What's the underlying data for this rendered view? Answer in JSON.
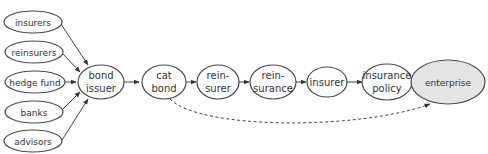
{
  "diagram": {
    "type": "flow",
    "background": "#ffffff",
    "highlight_fill": "#e4e4e4",
    "sources": [
      {
        "id": "insurers",
        "label": "insurers"
      },
      {
        "id": "reinsurers",
        "label": "reinsurers"
      },
      {
        "id": "hedge_fund",
        "label": "hedge fund"
      },
      {
        "id": "banks",
        "label": "banks"
      },
      {
        "id": "advisors",
        "label": "advisors"
      }
    ],
    "chain": [
      {
        "id": "bond_issuer",
        "line1": "bond",
        "line2": "issuer"
      },
      {
        "id": "cat_bond",
        "line1": "cat",
        "line2": "bond"
      },
      {
        "id": "reinsurer",
        "line1": "rein-",
        "line2": "surer"
      },
      {
        "id": "reinsurance",
        "line1": "rein-",
        "line2": "surance"
      },
      {
        "id": "insurer",
        "line1": "insurer"
      },
      {
        "id": "insurance_policy",
        "line1": "insurance",
        "line2": "policy"
      },
      {
        "id": "enterprise",
        "line1": "enterprise",
        "highlighted": true
      }
    ],
    "edges": [
      {
        "from": "insurers",
        "to": "bond_issuer",
        "style": "solid"
      },
      {
        "from": "reinsurers",
        "to": "bond_issuer",
        "style": "solid"
      },
      {
        "from": "hedge_fund",
        "to": "bond_issuer",
        "style": "solid"
      },
      {
        "from": "banks",
        "to": "bond_issuer",
        "style": "solid"
      },
      {
        "from": "advisors",
        "to": "bond_issuer",
        "style": "solid"
      },
      {
        "from": "bond_issuer",
        "to": "cat_bond",
        "style": "solid"
      },
      {
        "from": "cat_bond",
        "to": "reinsurer",
        "style": "solid"
      },
      {
        "from": "reinsurer",
        "to": "reinsurance",
        "style": "solid"
      },
      {
        "from": "reinsurance",
        "to": "insurer",
        "style": "solid"
      },
      {
        "from": "insurer",
        "to": "insurance_policy",
        "style": "solid"
      },
      {
        "from": "insurance_policy",
        "to": "enterprise",
        "style": "solid"
      },
      {
        "from": "cat_bond",
        "to": "enterprise",
        "style": "dashed"
      }
    ]
  }
}
